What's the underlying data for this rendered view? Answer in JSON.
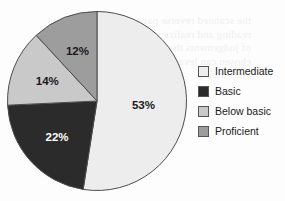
{
  "chart_data": {
    "type": "pie",
    "title": "",
    "labels": [
      "Intermediate",
      "Basic",
      "Below basic",
      "Proficient"
    ],
    "values": [
      53,
      22,
      14,
      12
    ],
    "data_labels": [
      "53%",
      "22%",
      "14%",
      "12%"
    ],
    "colors": [
      "#ededed",
      "#2b2b2b",
      "#c9c9c9",
      "#9d9d9d"
    ],
    "label_text_colors": [
      "#1a1a1a",
      "#ffffff",
      "#1a1a1a",
      "#1a1a1a"
    ],
    "start_angle_deg": 0,
    "direction": "clockwise",
    "legend_position": "right",
    "grid": false
  },
  "legend": {
    "items": [
      {
        "label": "Intermediate",
        "color": "#ededed"
      },
      {
        "label": "Basic",
        "color": "#2b2b2b"
      },
      {
        "label": "Below basic",
        "color": "#c9c9c9"
      },
      {
        "label": "Proficient",
        "color": "#9d9d9d"
      }
    ]
  },
  "artifact": {
    "bleed_text": "the scanned reverse page show through faint reading and realize wheth can reason with the of judgements the literal estimates of being chosen can level and understand with considering"
  }
}
